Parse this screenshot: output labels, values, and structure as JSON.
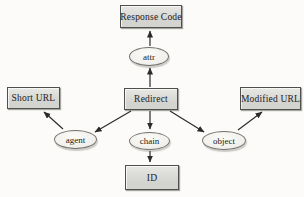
{
  "diagram": {
    "nodes": {
      "response_code": {
        "label": "Response Code",
        "type": "box"
      },
      "attr": {
        "label": "attr",
        "type": "ellipse"
      },
      "short_url": {
        "label": "Short URL",
        "type": "box"
      },
      "redirect": {
        "label": "Redirect",
        "type": "box"
      },
      "modified_url": {
        "label": "Modified URL",
        "type": "box"
      },
      "agent": {
        "label": "agent",
        "type": "ellipse"
      },
      "chain": {
        "label": "chain",
        "type": "ellipse"
      },
      "object": {
        "label": "object",
        "type": "ellipse"
      },
      "id": {
        "label": "ID",
        "type": "box"
      }
    },
    "edges": [
      {
        "from": "redirect",
        "to": "attr"
      },
      {
        "from": "attr",
        "to": "response_code"
      },
      {
        "from": "redirect",
        "to": "agent"
      },
      {
        "from": "agent",
        "to": "short_url"
      },
      {
        "from": "redirect",
        "to": "chain"
      },
      {
        "from": "chain",
        "to": "id"
      },
      {
        "from": "redirect",
        "to": "object"
      },
      {
        "from": "object",
        "to": "modified_url"
      }
    ],
    "colors": {
      "background": "#fcfbf9",
      "box_fill": "#d3d3d0",
      "box_border": "#4f4f4c",
      "ellipse_fill": "#efeeea",
      "ellipse_border": "#73716c",
      "arrow": "#2b2b28",
      "text": "#222222"
    }
  }
}
